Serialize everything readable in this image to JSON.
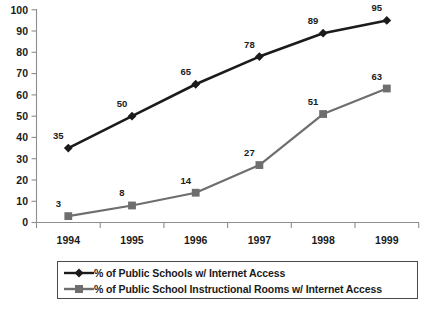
{
  "chart_data": {
    "type": "line",
    "title": "",
    "subtitle": "",
    "xlabel": "",
    "ylabel": "",
    "categories": [
      "1994",
      "1995",
      "1996",
      "1997",
      "1998",
      "1999"
    ],
    "x": [
      1994,
      1995,
      1996,
      1997,
      1998,
      1999
    ],
    "ylim": [
      0,
      100
    ],
    "yticks": [
      0,
      10,
      20,
      30,
      40,
      50,
      60,
      70,
      80,
      90,
      100
    ],
    "ytick_labels": [
      "0",
      "10",
      "20",
      "30",
      "40",
      "50",
      "60",
      "70",
      "80",
      "90",
      "100"
    ],
    "grid": false,
    "legend_position": "bottom",
    "series": [
      {
        "name": "% of Public Schools w/ Internet Access",
        "values": [
          35,
          50,
          65,
          78,
          89,
          95
        ],
        "data_labels": [
          "35",
          "50",
          "65",
          "78",
          "89",
          "95"
        ],
        "color": "#1b1b1b",
        "marker": "diamond"
      },
      {
        "name": "% of Public School Instructional Rooms w/ Internet Access",
        "values": [
          3,
          8,
          14,
          27,
          51,
          63
        ],
        "data_labels": [
          "3",
          "8",
          "14",
          "27",
          "51",
          "63"
        ],
        "color": "#6e6e6e",
        "marker": "square"
      }
    ]
  },
  "legend": {
    "entries": [
      {
        "label": "% of Public Schools w/ Internet Access",
        "marker": "diamond-marker",
        "color": "#1b1b1b"
      },
      {
        "label": "% of Public School Instructional Rooms w/ Internet Access",
        "marker": "square-marker",
        "color": "#6e6e6e"
      }
    ]
  },
  "caption": {
    "text": ""
  },
  "colors": {
    "series_1": "#1b1b1b",
    "series_2": "#6e6e6e",
    "axis": "#8d8d8d",
    "text": "#1b1b1b",
    "background": "#ffffff"
  }
}
